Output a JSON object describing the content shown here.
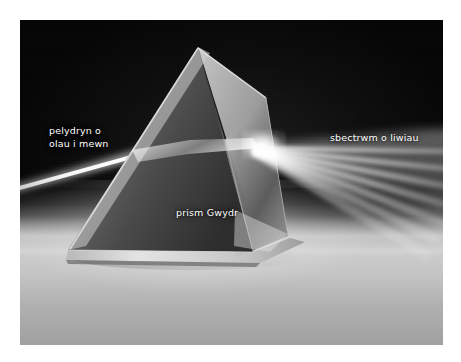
{
  "figure": {
    "kind": "photo-diagram",
    "language": "Welsh",
    "canvas": {
      "width": 461,
      "height": 362,
      "background": "#ffffff"
    },
    "photo": {
      "left": 20,
      "top": 20,
      "width": 423,
      "height": 325,
      "background": "#050505"
    }
  },
  "labels": {
    "incident_beam": "pelydryn o\nolau i mewn",
    "prism": "prism Gwydr",
    "spectrum": "sbectrwm o liwiau"
  },
  "colors": {
    "label_text": "#ffffff",
    "backdrop_dark": "#050505",
    "backdrop_mid": "#1c1c1c",
    "surface_light": "#cdcdcd",
    "surface_mid": "#b0b0b0",
    "beam_white": "#ffffff",
    "glass_light": "#d8d8d8",
    "glass_mid": "#8c8c8c",
    "glass_dark": "#3a3a3a",
    "page_background": "#ffffff"
  },
  "elements": {
    "prism_name": "triangular-glass-prism",
    "incident_beam_name": "incident-white-light-beam",
    "spectrum_name": "dispersed-spectrum-fan",
    "surface_name": "table-surface",
    "hotspot_name": "exit-hotspot"
  }
}
